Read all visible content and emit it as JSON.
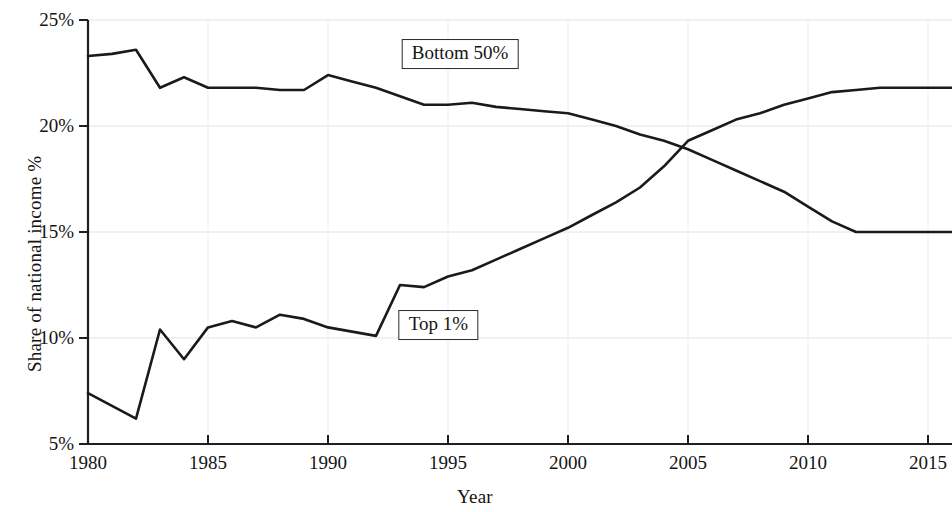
{
  "chart_data": {
    "type": "line",
    "title": "",
    "xlabel": "Year",
    "ylabel": "Share of national income %",
    "xlim": [
      1980,
      2016
    ],
    "ylim": [
      5,
      25
    ],
    "xticks": [
      1980,
      1985,
      1990,
      1995,
      2000,
      2005,
      2010,
      2015
    ],
    "xtick_labels": [
      "1980",
      "1985",
      "1990",
      "1995",
      "2000",
      "2005",
      "2010",
      "2015"
    ],
    "yticks": [
      5,
      10,
      15,
      20,
      25
    ],
    "ytick_labels": [
      "5%",
      "10%",
      "15%",
      "20%",
      "25%"
    ],
    "grid": "faint",
    "legend_position": "inline-labels",
    "line_color": "#1a1a1a",
    "x": [
      1980,
      1981,
      1982,
      1983,
      1984,
      1985,
      1986,
      1987,
      1988,
      1989,
      1990,
      1991,
      1992,
      1993,
      1994,
      1995,
      1996,
      1997,
      1998,
      1999,
      2000,
      2001,
      2002,
      2003,
      2004,
      2005,
      2006,
      2007,
      2008,
      2009,
      2010,
      2011,
      2012,
      2013,
      2014,
      2015,
      2016
    ],
    "series": [
      {
        "name": "Bottom 50%",
        "label": "Bottom 50%",
        "values": [
          23.3,
          23.4,
          23.6,
          21.8,
          22.3,
          21.8,
          21.8,
          21.8,
          21.7,
          21.7,
          22.4,
          22.1,
          21.8,
          21.4,
          21.0,
          21.0,
          21.1,
          20.9,
          20.8,
          20.7,
          20.6,
          20.3,
          20.0,
          19.6,
          19.3,
          18.9,
          18.4,
          17.9,
          17.4,
          16.9,
          16.2,
          15.5,
          15.0,
          15.0,
          15.0,
          15.0,
          15.0
        ]
      },
      {
        "name": "Top 1%",
        "label": "Top 1%",
        "values": [
          7.4,
          6.8,
          6.2,
          10.4,
          9.0,
          10.5,
          10.8,
          10.5,
          11.1,
          10.9,
          10.5,
          10.3,
          10.1,
          12.5,
          12.4,
          12.9,
          13.2,
          13.7,
          14.2,
          14.7,
          15.2,
          15.8,
          16.4,
          17.1,
          18.1,
          19.3,
          19.8,
          20.3,
          20.6,
          21.0,
          21.3,
          21.6,
          21.7,
          21.8,
          21.8,
          21.8,
          21.8
        ]
      }
    ],
    "annotations": [
      {
        "text": "Bottom 50%",
        "x": 1995.5,
        "y": 23.4
      },
      {
        "text": "Top 1%",
        "x": 1994.6,
        "y": 10.6
      }
    ]
  }
}
